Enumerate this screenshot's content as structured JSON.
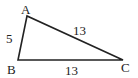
{
  "diagram": {
    "type": "triangle",
    "vertices": [
      {
        "label": "A",
        "x": 27,
        "y": 16
      },
      {
        "label": "B",
        "x": 18,
        "y": 60
      },
      {
        "label": "C",
        "x": 123,
        "y": 60
      }
    ],
    "sides": [
      {
        "between": "AB",
        "length_label": "5"
      },
      {
        "between": "AC",
        "length_label": "13"
      },
      {
        "between": "BC",
        "length_label": "13"
      }
    ],
    "stroke_color": "#222222"
  }
}
